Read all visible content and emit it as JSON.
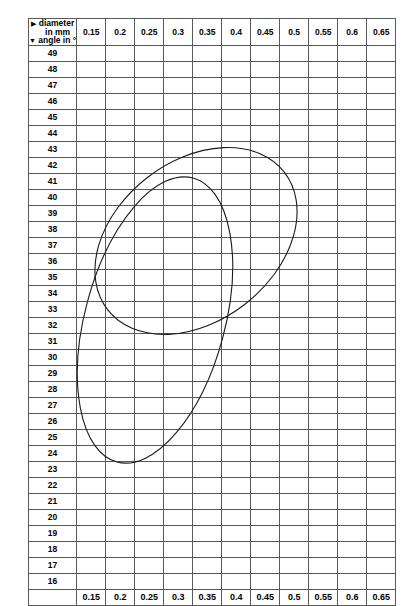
{
  "header": {
    "corner": {
      "line1": "diameter",
      "line2": "in mm",
      "line3": "angle in °",
      "tri_right": "▶",
      "tri_down": "▼"
    },
    "columns": [
      "0.15",
      "0.2",
      "0.25",
      "0.3",
      "0.35",
      "0.4",
      "0.45",
      "0.5",
      "0.55",
      "0.6",
      "0.65"
    ]
  },
  "footer": {
    "columns": [
      "0.15",
      "0.2",
      "0.25",
      "0.3",
      "0.35",
      "0.4",
      "0.45",
      "0.5",
      "0.55",
      "0.6",
      "0.65"
    ]
  },
  "colors": {
    "grid_line": "#58595b",
    "text": "#000000",
    "ellipse": "#1a1a1a",
    "background": "#ffffff"
  },
  "chart_data": {
    "type": "table",
    "title": "",
    "xlabel": "diameter in mm",
    "ylabel": "angle in °",
    "x_categories": [
      "0.15",
      "0.2",
      "0.25",
      "0.3",
      "0.35",
      "0.4",
      "0.45",
      "0.5",
      "0.55",
      "0.6",
      "0.65"
    ],
    "y_categories": [
      "49",
      "48",
      "47",
      "46",
      "45",
      "44",
      "43",
      "42",
      "41",
      "40",
      "39",
      "38",
      "37",
      "36",
      "35",
      "34",
      "33",
      "32",
      "31",
      "30",
      "29",
      "28",
      "27",
      "26",
      "25",
      "24",
      "23",
      "22",
      "21",
      "20",
      "19",
      "18",
      "17",
      "16"
    ],
    "grid": true,
    "legend": [],
    "annotations": [
      {
        "name": "ellipse-1",
        "shape": "ellipse",
        "cx": 196,
        "cy": 241,
        "rx": 112,
        "ry": 80,
        "rotation": -38
      },
      {
        "name": "ellipse-2",
        "shape": "ellipse",
        "cx": 155,
        "cy": 320,
        "rx": 70,
        "ry": 147,
        "rotation": 15
      }
    ],
    "marks": {
      "49": {},
      "48": {},
      "47": {},
      "46": {
        "0.3": "x/",
        "0.35": "/"
      },
      "45": {
        "0.2": "o",
        "0.3": "//",
        "0.4": "/"
      },
      "44": {
        "0.25": "/",
        "0.3": "//"
      },
      "43": {},
      "42": {},
      "41": {},
      "40": {
        "0.2": "oo",
        "0.3": "o",
        "0.4": "/"
      },
      "39": {
        "0.25": "o"
      },
      "38": {
        "0.15": "o",
        "0.25": "o/",
        "0.35": "//",
        "0.4": "x/",
        "0.5": "x"
      },
      "37": {
        "0.25": "o",
        "0.35": "x/",
        "0.45": "/",
        "0.5": "/"
      },
      "36": {
        "0.2": "o",
        "0.3": "/",
        "0.35": "/",
        "0.45": "x/"
      },
      "35": {
        "0.25": "o",
        "0.3": "ox",
        "0.35": "o/",
        "0.4": "/"
      },
      "34": {
        "0.3": "oo",
        "0.4": "/",
        "0.55": "/"
      },
      "33": {
        "0.2": "o",
        "0.35": "x",
        "0.4": "x"
      },
      "32": {
        "0.35": "ox",
        "0.4": "x",
        "0.45": "x"
      },
      "31": {
        "0.25": "x/",
        "0.3": "oo",
        "0.35": "x",
        "0.4": "xxxx",
        "0.45": "/",
        "0.5": "/",
        "0.6": "x"
      },
      "30": {
        "0.3": "o",
        "0.45": "xx/"
      },
      "29": {
        "0.2": "o",
        "0.3": "o",
        "0.55": "/"
      },
      "28": {
        "0.2": "o",
        "0.35": "o",
        "0.4": "ox",
        "0.45": "xxx"
      },
      "27": {
        "0.25": "oo",
        "0.3": "ox",
        "0.35": "oox",
        "0.4": "o"
      },
      "26": {
        "0.3": "o",
        "0.55": "x"
      },
      "25": {
        "0.3": "o",
        "0.4": "x"
      },
      "24": {},
      "23": {
        "0.3": "oo",
        "0.4": "/",
        "0.6": "/",
        "0.65": "x"
      },
      "22": {
        "0.3": "o",
        "0.45": "x"
      },
      "21": {
        "0.25": "o"
      },
      "20": {
        "0.25": "o",
        "0.35": "o"
      },
      "19": {
        "0.25": "o"
      },
      "18": {},
      "17": {},
      "16": {
        "0.35": "o"
      }
    }
  }
}
